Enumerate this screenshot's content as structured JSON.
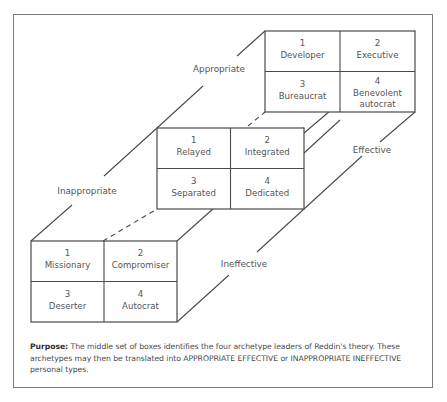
{
  "diagram": {
    "axis_labels": {
      "appropriate": "Appropriate",
      "inappropriate": "Inappropriate",
      "effective": "Effective",
      "ineffective": "Ineffective"
    },
    "grids": {
      "top": [
        {
          "num": "1",
          "lines": [
            "Developer"
          ]
        },
        {
          "num": "2",
          "lines": [
            "Executive"
          ]
        },
        {
          "num": "3",
          "lines": [
            "Bureaucrat"
          ]
        },
        {
          "num": "4",
          "lines": [
            "Benevolent",
            "autocrat"
          ]
        }
      ],
      "middle": [
        {
          "num": "1",
          "lines": [
            "Relayed"
          ]
        },
        {
          "num": "2",
          "lines": [
            "Integrated"
          ]
        },
        {
          "num": "3",
          "lines": [
            "Separated"
          ]
        },
        {
          "num": "4",
          "lines": [
            "Dedicated"
          ]
        }
      ],
      "front": [
        {
          "num": "1",
          "lines": [
            "Missionary"
          ]
        },
        {
          "num": "2",
          "lines": [
            "Compromiser"
          ]
        },
        {
          "num": "3",
          "lines": [
            "Deserter"
          ]
        },
        {
          "num": "4",
          "lines": [
            "Autocrat"
          ]
        }
      ]
    }
  },
  "caption": {
    "label": "Purpose:",
    "text": " The middle set of boxes identifies the four archetype leaders of Reddin's theory. These archetypes may then be translated into APPROPRIATE EFFECTIVE or INAPPROPRIATE INEFFECTIVE personal types."
  }
}
